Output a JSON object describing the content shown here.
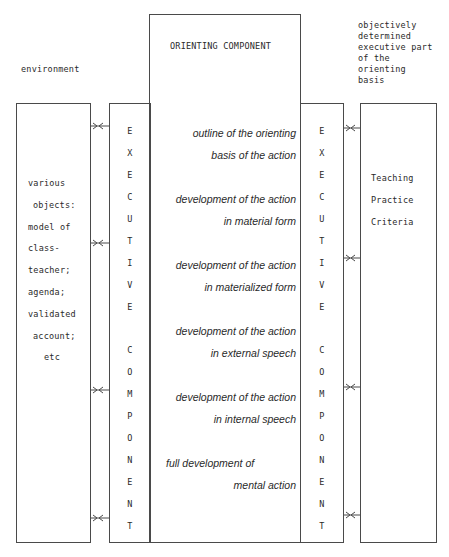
{
  "labels": {
    "environment": "environment",
    "orienting_component": "ORIENTING COMPONENT",
    "objective_part": [
      "objectively",
      "determined",
      "executive part",
      "of the",
      "orienting",
      "basis"
    ]
  },
  "left_box": {
    "lines": [
      "various",
      "objects:",
      "model of",
      "class-",
      "teacher;",
      "agenda;",
      "validated",
      "account;",
      "etc"
    ]
  },
  "right_box": {
    "lines": [
      "Teaching",
      "Practice",
      "Criteria"
    ]
  },
  "executive_column_left": {
    "letters": [
      "E",
      "X",
      "E",
      "C",
      "U",
      "T",
      "I",
      "V",
      "E",
      "",
      "C",
      "O",
      "M",
      "P",
      "O",
      "N",
      "E",
      "N",
      "T"
    ]
  },
  "executive_column_right": {
    "letters": [
      "E",
      "X",
      "E",
      "C",
      "U",
      "T",
      "I",
      "V",
      "E",
      "",
      "C",
      "O",
      "M",
      "P",
      "O",
      "N",
      "E",
      "N",
      "T"
    ]
  },
  "orienting_stages": [
    {
      "line1": "outline of the orienting",
      "line2": "basis of the action"
    },
    {
      "line1": "development of the action",
      "line2": "in material form"
    },
    {
      "line1": "development of the action",
      "line2": "in materialized form"
    },
    {
      "line1": "development of the action",
      "line2": "in external speech"
    },
    {
      "line1": "development of the action",
      "line2": "in internal speech"
    },
    {
      "line1": "full development of",
      "line2": "mental action"
    }
  ],
  "connectors": {
    "left_y": [
      126,
      243,
      390,
      518
    ],
    "right_y": [
      128,
      258,
      387,
      515
    ]
  }
}
